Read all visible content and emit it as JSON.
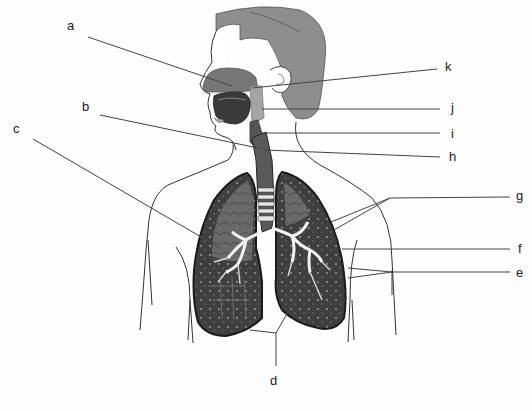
{
  "diagram": {
    "labels": [
      {
        "id": "a",
        "text": "a",
        "x": 67,
        "y": 19
      },
      {
        "id": "b",
        "text": "b",
        "x": 82,
        "y": 100
      },
      {
        "id": "c",
        "text": "c",
        "x": 13,
        "y": 122
      },
      {
        "id": "d",
        "text": "d",
        "x": 267,
        "y": 374
      },
      {
        "id": "e",
        "text": "e",
        "x": 518,
        "y": 267
      },
      {
        "id": "f",
        "text": "f",
        "x": 518,
        "y": 243
      },
      {
        "id": "g",
        "text": "g",
        "x": 518,
        "y": 188
      },
      {
        "id": "h",
        "text": "h",
        "x": 449,
        "y": 150
      },
      {
        "id": "i",
        "text": "i",
        "x": 449,
        "y": 127
      },
      {
        "id": "j",
        "text": "j",
        "x": 449,
        "y": 101
      },
      {
        "id": "k",
        "text": "k",
        "x": 445,
        "y": 60
      }
    ],
    "colors": {
      "hair": "#8e8e8e",
      "nasal": "#7a7a7a",
      "mouth": "#3c3c3c",
      "lung_light": "#8a8a8a",
      "lung_dark": "#3d3d3d",
      "outline": "#2a2a2a",
      "leader_line": "#444444",
      "background": "#fdfdfd"
    }
  }
}
